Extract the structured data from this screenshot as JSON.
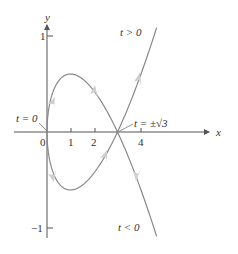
{
  "axes": {
    "x_label": "x",
    "y_label": "y",
    "x_ticks": [
      "0",
      "1",
      "2",
      "4"
    ],
    "y_ticks": [
      "1",
      "−1"
    ]
  },
  "annotations": {
    "t_pos": "t > 0",
    "t_neg": "t < 0",
    "t_zero": "t = 0",
    "t_root": "t = ±√3"
  },
  "curve": {
    "description": "parametric curve x = t², y = t³ − 3t",
    "color": "#888888",
    "arrow_color": "#c8c8c8"
  }
}
